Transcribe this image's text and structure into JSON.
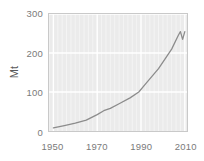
{
  "chart_data": {
    "type": "line",
    "title": "",
    "xlabel": "",
    "ylabel": "Mt",
    "xlim": [
      1948,
      2011
    ],
    "ylim": [
      0,
      300
    ],
    "xticks": [
      1950,
      1970,
      1990,
      2010
    ],
    "yticks": [
      0,
      100,
      200,
      300
    ],
    "xtick_labels": [
      "1950",
      "1970",
      "1990",
      "2010"
    ],
    "ytick_labels": [
      "0",
      "100",
      "200",
      "300"
    ],
    "grid": true,
    "grid_color": "#ffffff",
    "minor_grid": true,
    "legend": null,
    "plot_bgcolor": "#ebebeb",
    "line_color": "#8c8c8c",
    "series": [
      {
        "name": "Production",
        "x": [
          1950,
          1955,
          1960,
          1965,
          1970,
          1973,
          1976,
          1980,
          1985,
          1989,
          1992,
          1995,
          1998,
          2001,
          2004,
          2007,
          2008,
          2009,
          2010
        ],
        "values": [
          8,
          14,
          20,
          28,
          42,
          52,
          58,
          70,
          85,
          100,
          120,
          140,
          160,
          185,
          210,
          245,
          255,
          235,
          255
        ]
      }
    ]
  },
  "axis": {
    "ylabel_text": "Mt"
  }
}
